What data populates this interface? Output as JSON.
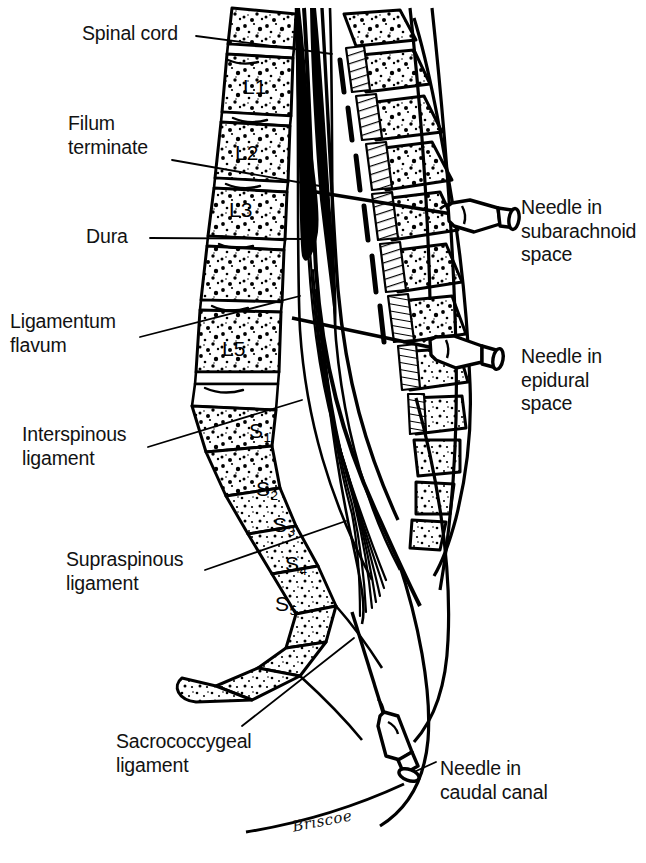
{
  "figure": {
    "background_color": "#ffffff",
    "ink_color": "#000000",
    "signature": "Briscoe"
  },
  "labels_left": [
    {
      "id": "spinal-cord",
      "text": "Spinal cord",
      "x": 82,
      "y": 22
    },
    {
      "id": "filum-terminate",
      "text": "Filum\nterminate",
      "x": 68,
      "y": 112
    },
    {
      "id": "dura",
      "text": "Dura",
      "x": 86,
      "y": 225
    },
    {
      "id": "ligamentum-flavum",
      "text": "Ligamentum\nflavum",
      "x": 10,
      "y": 310
    },
    {
      "id": "interspinous-ligament",
      "text": "Interspinous\nligament",
      "x": 22,
      "y": 423
    },
    {
      "id": "supraspinous-ligament",
      "text": "Supraspinous\nligament",
      "x": 66,
      "y": 548
    },
    {
      "id": "sacrococcygeal-ligament",
      "text": "Sacrococcygeal\nligament",
      "x": 116,
      "y": 730
    }
  ],
  "labels_right": [
    {
      "id": "needle-subarachnoid",
      "text": "Needle in\nsubarachnoid\nspace",
      "x": 521,
      "y": 196
    },
    {
      "id": "needle-epidural",
      "text": "Needle in\nepidural\nspace",
      "x": 521,
      "y": 345
    },
    {
      "id": "needle-caudal",
      "text": "Needle in\ncaudal canal",
      "x": 440,
      "y": 757
    }
  ],
  "vertebrae": [
    {
      "id": "L1",
      "letter": "L",
      "number": "1",
      "sub": false,
      "x": 243,
      "y": 75
    },
    {
      "id": "L2",
      "letter": "L",
      "number": "2",
      "sub": false,
      "x": 235,
      "y": 141
    },
    {
      "id": "L3",
      "letter": "L",
      "number": "3",
      "sub": false,
      "x": 229,
      "y": 198
    },
    {
      "id": "L5",
      "letter": "L",
      "number": "5",
      "sub": false,
      "x": 222,
      "y": 337
    },
    {
      "id": "S1",
      "letter": "S",
      "number": "1",
      "sub": true,
      "x": 249,
      "y": 419
    },
    {
      "id": "S2",
      "letter": "S",
      "number": "2",
      "sub": true,
      "x": 256,
      "y": 477
    },
    {
      "id": "S3",
      "letter": "S",
      "number": "3",
      "sub": true,
      "x": 273,
      "y": 513
    },
    {
      "id": "S4",
      "letter": "S",
      "number": "4",
      "sub": true,
      "x": 285,
      "y": 552
    },
    {
      "id": "S5",
      "letter": "S",
      "number": "5",
      "sub": true,
      "x": 275,
      "y": 592
    }
  ],
  "needles": [
    {
      "id": "needle-subarachnoid-device",
      "name": "subarachnoid-needle",
      "tip_x": 310,
      "tip_y": 191,
      "hub_x": 470,
      "hub_y": 222
    },
    {
      "id": "needle-epidural-device",
      "name": "epidural-needle",
      "tip_x": 292,
      "tip_y": 318,
      "hub_x": 450,
      "hub_y": 358
    },
    {
      "id": "needle-caudal-device",
      "name": "caudal-needle",
      "tip_x": 352,
      "tip_y": 612,
      "hub_x": 400,
      "hub_y": 772
    }
  ],
  "leader_lines": [
    {
      "id": "leader-spinal-cord",
      "from_x": 196,
      "from_y": 36,
      "to_x": 330,
      "to_y": 52
    },
    {
      "id": "leader-filum-terminate",
      "from_x": 172,
      "from_y": 160,
      "to_x": 318,
      "to_y": 186
    },
    {
      "id": "leader-dura",
      "from_x": 150,
      "from_y": 238,
      "to_x": 300,
      "to_y": 239
    },
    {
      "id": "leader-ligamentum-flavum",
      "from_x": 140,
      "from_y": 337,
      "to_x": 298,
      "to_y": 297
    },
    {
      "id": "leader-interspinous-ligament",
      "from_x": 148,
      "from_y": 447,
      "to_x": 300,
      "to_y": 400
    },
    {
      "id": "leader-supraspinous-ligament",
      "from_x": 205,
      "from_y": 570,
      "to_x": 344,
      "to_y": 522
    },
    {
      "id": "leader-sacrococcygeal-ligament",
      "from_x": 242,
      "from_y": 726,
      "to_x": 352,
      "to_y": 640
    }
  ]
}
